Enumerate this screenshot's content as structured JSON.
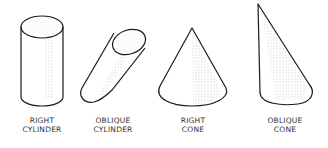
{
  "figure": {
    "shapes": [
      {
        "id": "right-cylinder",
        "label_lines": [
          "RIGHT",
          "CYLINDER"
        ]
      },
      {
        "id": "oblique-cylinder",
        "label_lines": [
          "OBLIQUE",
          "CYLINDER"
        ]
      },
      {
        "id": "right-cone",
        "label_lines": [
          "RIGHT",
          "CONE"
        ]
      },
      {
        "id": "oblique-cone",
        "label_lines": [
          "OBLIQUE",
          "CONE"
        ]
      }
    ],
    "colors": {
      "stroke": "#1a1a1a",
      "stipple": "#555555",
      "background": "#ffffff"
    }
  }
}
